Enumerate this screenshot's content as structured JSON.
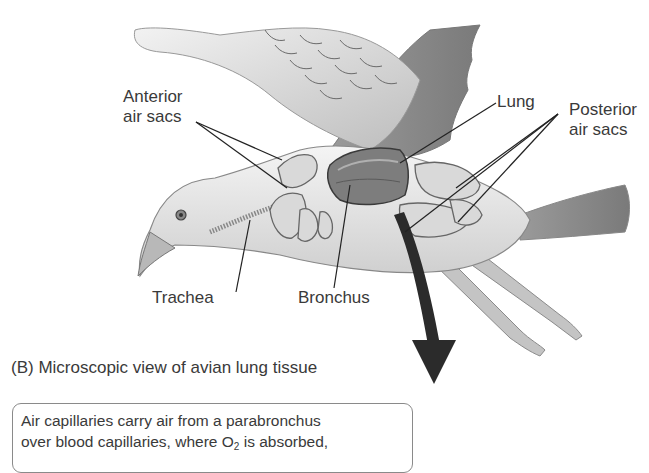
{
  "figure": {
    "labels": {
      "anterior_air_sacs": [
        "Anterior",
        "air sacs"
      ],
      "lung": "Lung",
      "posterior_air_sacs": [
        "Posterior",
        "air sacs"
      ],
      "trachea": "Trachea",
      "bronchus": "Bronchus"
    },
    "panel_b_caption": "(B)  Microscopic view of avian lung tissue",
    "callout": {
      "line1": "Air capillaries carry air from a parabronchus",
      "line2_before": "over blood capillaries, where O",
      "line2_sub": "2",
      "line2_after": " is absorbed,"
    },
    "arrow": {
      "direction": "down",
      "color": "#2b2b2b"
    },
    "colors": {
      "text": "#3a3a3a",
      "leader_lines": "#222222",
      "callout_border": "#8a8a8a"
    }
  }
}
